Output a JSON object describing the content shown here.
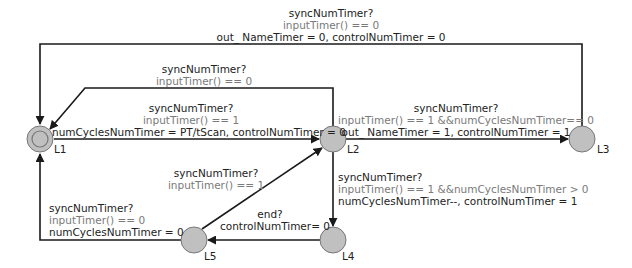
{
  "colors": {
    "edge": "#1a1a1a",
    "node_fill": "#c0c0c0",
    "node_stroke": "#777777",
    "guard_text": "#7a7a7a",
    "label_text": "#222222",
    "background": "#ffffff"
  },
  "nodes": [
    {
      "id": "L1",
      "name": "L1",
      "initial": true,
      "x": 40,
      "y": 139
    },
    {
      "id": "L2",
      "name": "L2",
      "initial": false,
      "x": 333,
      "y": 139
    },
    {
      "id": "L3",
      "name": "L3",
      "initial": false,
      "x": 582,
      "y": 139
    },
    {
      "id": "L4",
      "name": "L4",
      "initial": false,
      "x": 333,
      "y": 240
    },
    {
      "id": "L5",
      "name": "L5",
      "initial": false,
      "x": 194,
      "y": 240
    }
  ],
  "edges": [
    {
      "id": "L3_to_L1_top",
      "from": "L3",
      "to": "L1",
      "sync": "syncNumTimer?",
      "guard": "inputTimer() == 0",
      "assign": "out_ NameTimer = 0, controlNumTimer = 0"
    },
    {
      "id": "L2_to_L1_upper",
      "from": "L2",
      "to": "L1",
      "sync": "syncNumTimer?",
      "guard": "inputTimer() == 0"
    },
    {
      "id": "L1_to_L2",
      "from": "L1",
      "to": "L2",
      "sync": "syncNumTimer?",
      "guard": "inputTimer() == 1",
      "assign": "numCyclesNumTimer = PT/tScan, controlNumTimer = 0"
    },
    {
      "id": "L2_to_L3",
      "from": "L2",
      "to": "L3",
      "sync": "syncNumTimer?",
      "guard": "inputTimer() == 1 &&numCyclesNumTimer== 0",
      "assign": "out_ NameTimer = 1, controlNumTimer = 1"
    },
    {
      "id": "L2_to_L4",
      "from": "L2",
      "to": "L4",
      "sync": "syncNumTimer?",
      "guard": "inputTimer() == 1 &&numCyclesNumTimer > 0",
      "assign": "numCyclesNumTimer--, controlNumTimer = 1"
    },
    {
      "id": "L5_to_L2",
      "from": "L5",
      "to": "L2",
      "sync": "syncNumTimer?",
      "guard": "inputTimer() == 1"
    },
    {
      "id": "L4_to_L5",
      "from": "L4",
      "to": "L5",
      "sync": "end?",
      "assign": "controlNumTimer= 0"
    },
    {
      "id": "L5_to_L1",
      "from": "L5",
      "to": "L1",
      "sync": "syncNumTimer?",
      "guard": "inputTimer() == 0",
      "assign": "numCyclesNumTimer = 0"
    }
  ]
}
